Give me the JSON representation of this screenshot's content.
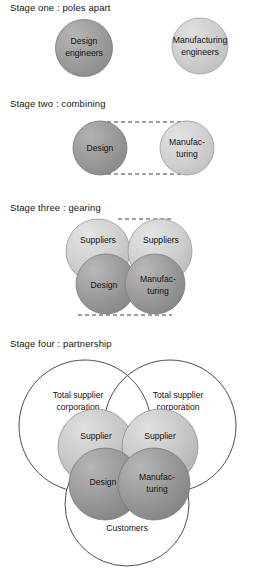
{
  "diagram": {
    "title_text_present": false,
    "stages": [
      {
        "id": "stage-one",
        "label": "Stage one : poles apart",
        "circles": [
          {
            "name": "design-engineers",
            "lines": [
              "Design",
              "engineers"
            ],
            "fill": "dark"
          },
          {
            "name": "manufacturing-engineers",
            "lines": [
              "Manufacturing",
              "engineers"
            ],
            "fill": "light"
          }
        ],
        "connectors": []
      },
      {
        "id": "stage-two",
        "label": "Stage two : combining",
        "circles": [
          {
            "name": "design",
            "lines": [
              "Design"
            ],
            "fill": "dark"
          },
          {
            "name": "manufacturing",
            "lines": [
              "Manufac-",
              "turing"
            ],
            "fill": "light"
          }
        ],
        "connectors": [
          "dashed-top",
          "dashed-bottom"
        ]
      },
      {
        "id": "stage-three",
        "label": "Stage three : gearing",
        "circles": [
          {
            "name": "suppliers-left",
            "lines": [
              "Suppliers"
            ],
            "fill": "light"
          },
          {
            "name": "suppliers-right",
            "lines": [
              "Suppliers"
            ],
            "fill": "light"
          },
          {
            "name": "design",
            "lines": [
              "Design"
            ],
            "fill": "dark"
          },
          {
            "name": "manufacturing",
            "lines": [
              "Manufac-",
              "turing"
            ],
            "fill": "dark"
          }
        ],
        "connectors": [
          "dashed-top",
          "dashed-bottom"
        ]
      },
      {
        "id": "stage-four",
        "label": "Stage four : partnership",
        "circles": [
          {
            "name": "total-supplier-corporation-left",
            "lines": [
              "Total supplier",
              "corporation"
            ],
            "fill": "outline"
          },
          {
            "name": "total-supplier-corporation-right",
            "lines": [
              "Total supplier",
              "corporation"
            ],
            "fill": "outline"
          },
          {
            "name": "customers",
            "lines": [
              "Customers"
            ],
            "fill": "outline"
          },
          {
            "name": "supplier-left",
            "lines": [
              "Supplier"
            ],
            "fill": "light"
          },
          {
            "name": "supplier-right",
            "lines": [
              "Supplier"
            ],
            "fill": "light"
          },
          {
            "name": "design",
            "lines": [
              "Design"
            ],
            "fill": "dark"
          },
          {
            "name": "manufacturing",
            "lines": [
              "Manufac-",
              "turing"
            ],
            "fill": "dark"
          }
        ],
        "connectors": []
      }
    ],
    "colors": {
      "dark_gray": "#9a9a9a",
      "light_gray": "#c9c9c9",
      "outline": "#3c3c3c",
      "text": "#121212",
      "background": "#ffffff"
    }
  }
}
